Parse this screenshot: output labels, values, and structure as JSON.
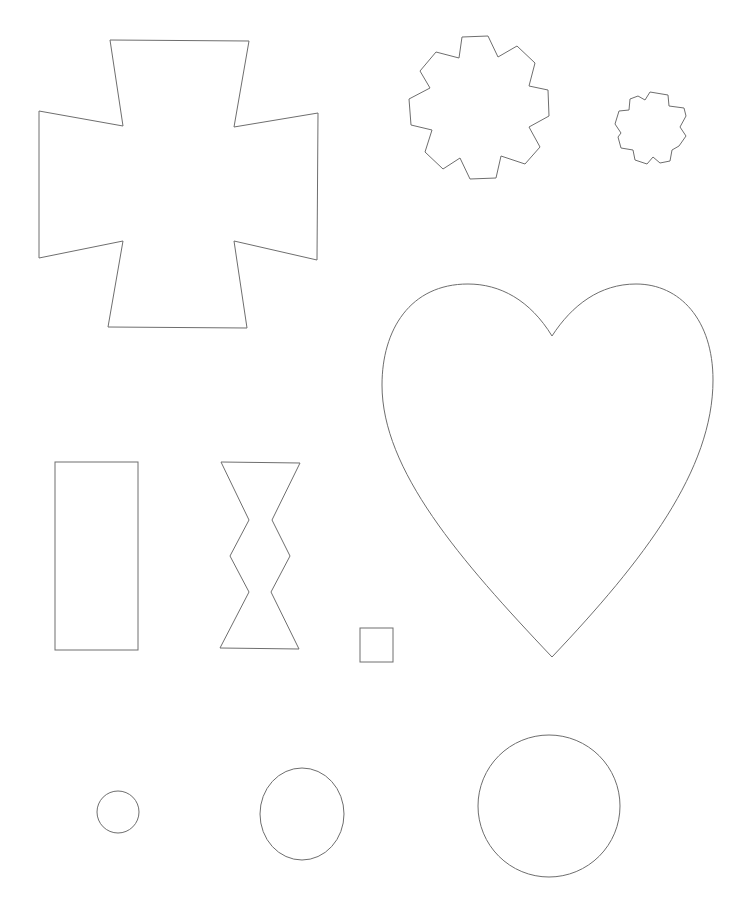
{
  "page": {
    "background": "#ffffff",
    "stroke_color": "#6e6e6e",
    "width": 744,
    "height": 920
  },
  "shapes": {
    "cross": {
      "kind": "polygon",
      "points": "110,40 249,41 234,127 318,113 317,260 234,241 247,328 108,327 123,241 39,258 39,111 123,126"
    },
    "large_gear": {
      "kind": "polygon",
      "points": "462,37 488,36 498,57 517,46 535,63 529,86 548,90 549,116 529,127 540,147 525,164 501,156 496,178 470,179 460,158 443,169 425,152 432,130 411,125 409,99 430,88 420,71 436,52 459,58"
    },
    "small_gear": {
      "kind": "polygon",
      "points": "630,99 638,96 645,100 650,92 668,95 669,106 684,108 686,116 680,127 686,136 679,146 672,150 670,161 660,163 653,157 647,164 635,160 633,150 621,148 618,137 621,133 615,124 619,111 629,110"
    },
    "heart": {
      "kind": "path",
      "d": "M552,336 C530,300 500,284 468,284 C410,284 382,330 382,385 C382,470 460,560 552,657 C644,560 713,470 713,380 C713,320 680,284 636,284 C600,284 572,305 552,336 Z"
    },
    "rectangle": {
      "kind": "rect",
      "x": 55,
      "y": 462,
      "width": 83,
      "height": 188
    },
    "bowtie": {
      "kind": "polygon",
      "points": "221,462 300,463 272,520 290,556 271,592 299,649 220,648 249,592 230,556 249,520"
    },
    "small_square": {
      "kind": "rect",
      "x": 360,
      "y": 628,
      "width": 33,
      "height": 34
    },
    "small_circle": {
      "kind": "circle",
      "cx": 118,
      "cy": 812,
      "r": 21
    },
    "medium_circle": {
      "kind": "ellipse",
      "cx": 302,
      "cy": 814,
      "rx": 42,
      "ry": 46
    },
    "large_circle": {
      "kind": "circle",
      "cx": 549,
      "cy": 806,
      "r": 71
    }
  }
}
